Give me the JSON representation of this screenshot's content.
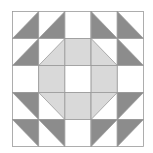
{
  "quilt": {
    "title": "",
    "rows": 5,
    "cols": 5,
    "colors": {
      "background": "#ffffff",
      "dark": "#8c8c8c",
      "light": "#d9d9d9",
      "line": "#9a9a9a"
    },
    "cells": [
      [
        {
          "type": "half",
          "fill": "dark",
          "corner": "br"
        },
        {
          "type": "half",
          "fill": "dark",
          "corner": "br"
        },
        {
          "type": "empty"
        },
        {
          "type": "half",
          "fill": "dark",
          "corner": "bl"
        },
        {
          "type": "half",
          "fill": "dark",
          "corner": "bl"
        }
      ],
      [
        {
          "type": "half",
          "fill": "dark",
          "corner": "br"
        },
        {
          "type": "half",
          "fill": "light",
          "corner": "br"
        },
        {
          "type": "full",
          "fill": "light"
        },
        {
          "type": "half",
          "fill": "light",
          "corner": "bl"
        },
        {
          "type": "half",
          "fill": "dark",
          "corner": "bl"
        }
      ],
      [
        {
          "type": "empty"
        },
        {
          "type": "full",
          "fill": "light"
        },
        {
          "type": "empty"
        },
        {
          "type": "full",
          "fill": "light"
        },
        {
          "type": "empty"
        }
      ],
      [
        {
          "type": "half",
          "fill": "dark",
          "corner": "tr"
        },
        {
          "type": "half",
          "fill": "light",
          "corner": "tr"
        },
        {
          "type": "full",
          "fill": "light"
        },
        {
          "type": "half",
          "fill": "light",
          "corner": "tl"
        },
        {
          "type": "half",
          "fill": "dark",
          "corner": "tl"
        }
      ],
      [
        {
          "type": "half",
          "fill": "dark",
          "corner": "tr"
        },
        {
          "type": "half",
          "fill": "dark",
          "corner": "tr"
        },
        {
          "type": "empty"
        },
        {
          "type": "half",
          "fill": "dark",
          "corner": "tl"
        },
        {
          "type": "half",
          "fill": "dark",
          "corner": "tl"
        }
      ]
    ]
  }
}
